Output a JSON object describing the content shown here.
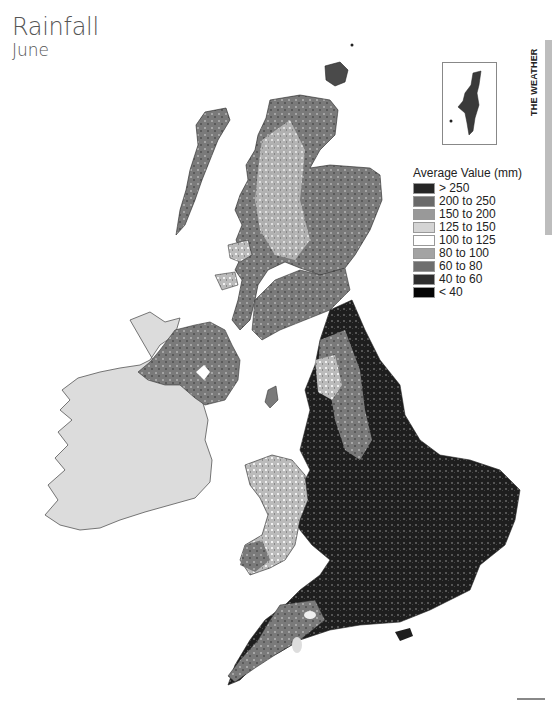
{
  "header": {
    "title": "Rainfall",
    "subtitle": "June"
  },
  "side_tab": {
    "label": "THE WEATHER"
  },
  "legend": {
    "title": "Average Value (mm)",
    "items": [
      {
        "label": "> 250",
        "color": "#262626"
      },
      {
        "label": "200 to 250",
        "color": "#6a6a6a"
      },
      {
        "label": "150 to 200",
        "color": "#999999"
      },
      {
        "label": "125 to 150",
        "color": "#d4d4d4"
      },
      {
        "label": "100 to 125",
        "color": "#ffffff"
      },
      {
        "label": "80 to 100",
        "color": "#a3a3a3"
      },
      {
        "label": "60 to 80",
        "color": "#6e6e6e"
      },
      {
        "label": "40 to 60",
        "color": "#2e2e2e"
      },
      {
        "label": "< 40",
        "color": "#050505"
      }
    ]
  },
  "map": {
    "regions": [
      {
        "name": "Ireland (no data)",
        "color": "#dcdcdc"
      },
      {
        "name": "Northern Ireland",
        "color": "#6e6e6e"
      },
      {
        "name": "Scotland",
        "color": "#8a8a8a"
      },
      {
        "name": "England & Wales",
        "color": "#2e2e2e"
      }
    ],
    "inset": "Shetland Islands"
  }
}
